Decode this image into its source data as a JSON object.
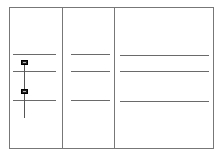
{
  "diagram": {
    "type": "wireframe-table",
    "columns": 3,
    "rows_lines": 3,
    "frame": {
      "x": 9,
      "y": 7,
      "w": 205,
      "h": 142
    },
    "dividers_x": [
      62,
      114
    ],
    "lines_y": [
      54,
      71,
      100
    ],
    "markers": [
      {
        "name": "top-marker",
        "x": 20,
        "y": 60
      },
      {
        "name": "bottom-marker",
        "x": 20,
        "y": 89
      }
    ],
    "colors": {
      "line": "#777777",
      "marker": "#222222",
      "background": "#ffffff"
    }
  }
}
